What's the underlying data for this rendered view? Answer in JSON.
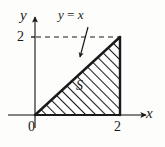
{
  "figure": {
    "background_color": "#fdfdfb",
    "ink_color": "#1a1a1a",
    "axes": {
      "x_axis_label": "x",
      "y_axis_label": "y",
      "origin_label": "0",
      "x_ticks": [
        {
          "value": 2,
          "label": "2"
        }
      ],
      "y_ticks": [
        {
          "value": 2,
          "label": "2"
        }
      ],
      "x_range": [
        0,
        2
      ],
      "y_range": [
        0,
        2
      ],
      "arrowheads": "both-axes-positive-direction"
    },
    "annotations": {
      "line_label": "y = x",
      "line_label_lhs": "y",
      "line_label_eq": " = ",
      "line_label_rhs": "x",
      "region_label": "S",
      "pointer": "arrow-from-label-to-line",
      "dashed_guide": "horizontal dashed line from y = 2 to point (2, 2)"
    },
    "region": {
      "name": "S",
      "shape": "right triangle",
      "vertices": [
        [
          0,
          0
        ],
        [
          2,
          0
        ],
        [
          2,
          2
        ]
      ],
      "fill": "diagonal-hatching",
      "hatch_angle_deg": 45,
      "area": 2
    }
  }
}
